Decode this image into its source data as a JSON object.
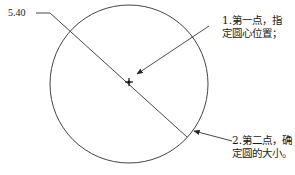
{
  "diagram": {
    "dimension_value": "5.40",
    "annotations": [
      {
        "id": "step1",
        "line1": "1.第一点，指",
        "line2": "定圆心位置；"
      },
      {
        "id": "step2",
        "line1": "2.第二点，确",
        "line2": "定圆的大小。"
      }
    ],
    "colors": {
      "stroke": "#333333",
      "background": "#ffffff"
    }
  }
}
